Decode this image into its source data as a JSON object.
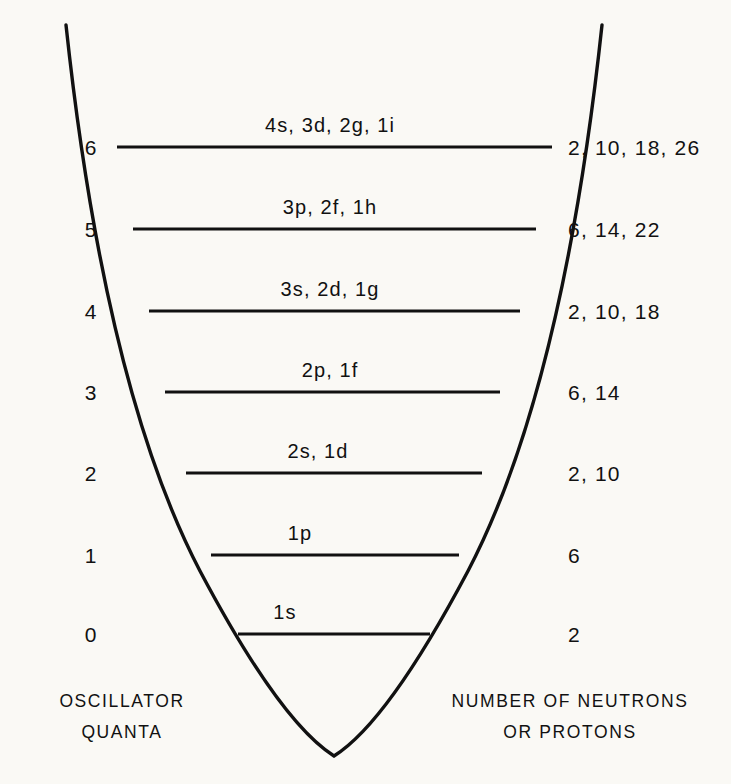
{
  "figure": {
    "type": "energy-level-diagram",
    "background_color": "#faf9f5",
    "ink_color": "#111111"
  },
  "axis_left": {
    "caption_lines": [
      "OSCILLATOR",
      "QUANTA"
    ],
    "tick_labels": [
      "6",
      "5",
      "4",
      "3",
      "2",
      "1",
      "0"
    ]
  },
  "axis_right": {
    "caption_lines": [
      "NUMBER OF NEUTRONS",
      "OR PROTONS"
    ]
  },
  "levels": [
    {
      "quanta": "6",
      "orbitals": "4s, 3d, 2g, 1i",
      "occupancy": "2, 10, 18, 26"
    },
    {
      "quanta": "5",
      "orbitals": "3p, 2f, 1h",
      "occupancy": "6, 14, 22"
    },
    {
      "quanta": "4",
      "orbitals": "3s, 2d, 1g",
      "occupancy": "2, 10, 18"
    },
    {
      "quanta": "3",
      "orbitals": "2p, 1f",
      "occupancy": "6, 14"
    },
    {
      "quanta": "2",
      "orbitals": "2s, 1d",
      "occupancy": "2, 10"
    },
    {
      "quanta": "1",
      "orbitals": "1p",
      "occupancy": "6"
    },
    {
      "quanta": "0",
      "orbitals": "1s",
      "occupancy": "2"
    }
  ],
  "geometry": {
    "vertex_x": 334,
    "vertex_y": 758,
    "curve_top_y": 25,
    "level_y": [
      147,
      229,
      311,
      392,
      473,
      555,
      634
    ],
    "level_x_left": [
      117,
      133,
      149,
      165,
      186,
      211,
      238
    ],
    "level_x_right": [
      552,
      536,
      520,
      500,
      482,
      459,
      430
    ],
    "quanta_label_x": 97,
    "orbital_label_x": [
      330,
      330,
      330,
      330,
      318,
      300,
      285
    ],
    "occupancy_label_x": 568,
    "caption_left_x": 122,
    "caption_right_x": 570,
    "caption_y": 693
  },
  "chart_data": {
    "type": "line",
    "title": "",
    "xlabel": "",
    "ylabel": "Oscillator quanta",
    "categories": [
      "0",
      "1",
      "2",
      "3",
      "4",
      "5",
      "6"
    ],
    "series": [
      {
        "name": "Orbitals",
        "values": [
          "1s",
          "1p",
          "2s, 1d",
          "2p, 1f",
          "3s, 2d, 1g",
          "3p, 2f, 1h",
          "4s, 3d, 2g, 1i"
        ]
      },
      {
        "name": "Occupancy",
        "values": [
          "2",
          "6",
          "2, 10",
          "6, 14",
          "2, 10, 18",
          "6, 14, 22",
          "2, 10, 18, 26"
        ]
      }
    ]
  }
}
